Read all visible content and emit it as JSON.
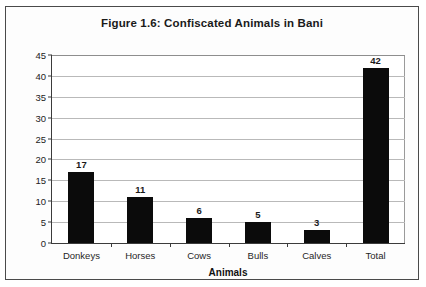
{
  "figure": {
    "title": "Figure 1.6: Confiscated Animals in Bani",
    "x_axis_title": "Animals"
  },
  "chart_data": {
    "type": "bar",
    "title": "Figure 1.6: Confiscated Animals in Bani",
    "xlabel": "Animals",
    "ylabel": "",
    "categories": [
      "Donkeys",
      "Horses",
      "Cows",
      "Bulls",
      "Calves",
      "Total"
    ],
    "values": [
      17,
      11,
      6,
      5,
      3,
      42
    ],
    "data_labels": [
      "17",
      "11",
      "6",
      "5",
      "3",
      "42"
    ],
    "ylim": [
      0,
      45
    ],
    "ytick_labels": [
      "0",
      "5",
      "10",
      "15",
      "20",
      "25",
      "30",
      "35",
      "40",
      "45"
    ],
    "ytick_values": [
      0,
      5,
      10,
      15,
      20,
      25,
      30,
      35,
      40,
      45
    ],
    "grid": true,
    "legend": false,
    "bar_color": "#0b0b0b",
    "gridline_color": "#b9b9b9",
    "axis_color": "#3b3b3b",
    "background_color": "#ffffff"
  }
}
